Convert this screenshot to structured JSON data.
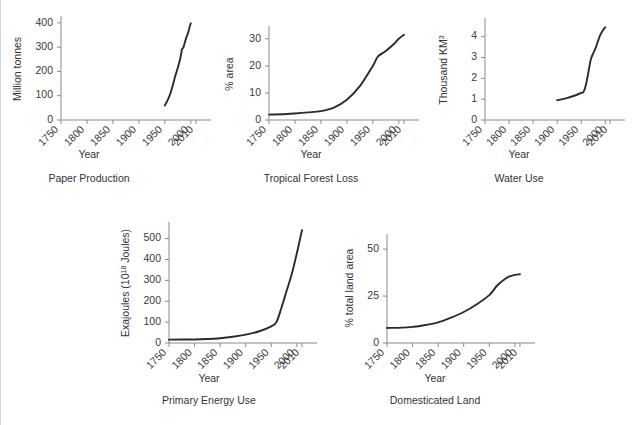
{
  "figure": {
    "background": "#ffffff",
    "line_color": "#2b2b2b",
    "axis_color": "#8a8a8a",
    "border_color": "#d8d8d8",
    "shared_xlabel": "Year",
    "shared_xticks": [
      "1750",
      "1800",
      "1850",
      "1900",
      "1950",
      "2000",
      "2010"
    ]
  },
  "chart_data": [
    {
      "type": "line",
      "title": "Paper Production",
      "xlabel": "Year",
      "ylabel": "Million tonnes",
      "xlim": [
        1750,
        2012
      ],
      "ylim": [
        0,
        420
      ],
      "xticks": [
        1750,
        1800,
        1850,
        1900,
        1950,
        2000,
        2010
      ],
      "xtick_labels": [
        "1750",
        "1800",
        "1850",
        "1900",
        "1950",
        "2000",
        "2010"
      ],
      "yticks": [
        0,
        100,
        200,
        300,
        400
      ],
      "ytick_labels": [
        "0",
        "100",
        "200",
        "300",
        "400"
      ],
      "grid": false,
      "legend": "none",
      "x": [
        1950,
        1955,
        1960,
        1965,
        1970,
        1975,
        1980,
        1983,
        1986,
        1990,
        1995,
        1998,
        2000
      ],
      "y": [
        60,
        80,
        105,
        140,
        180,
        215,
        255,
        290,
        300,
        330,
        360,
        385,
        398
      ]
    },
    {
      "type": "line",
      "title": "Tropical Forest Loss",
      "xlabel": "Year",
      "ylabel": "% area",
      "xlim": [
        1750,
        2012
      ],
      "ylim": [
        0,
        34
      ],
      "xticks": [
        1750,
        1800,
        1850,
        1900,
        1950,
        2000,
        2010
      ],
      "xtick_labels": [
        "1750",
        "1800",
        "1850",
        "1900",
        "1950",
        "2000",
        "2010"
      ],
      "yticks": [
        0,
        10,
        20,
        30
      ],
      "ytick_labels": [
        "0",
        "10",
        "20",
        "30"
      ],
      "grid": false,
      "legend": "none",
      "x": [
        1750,
        1775,
        1800,
        1825,
        1850,
        1875,
        1900,
        1925,
        1950,
        1960,
        1975,
        1990,
        2000,
        2010
      ],
      "y": [
        2.0,
        2.1,
        2.4,
        2.8,
        3.3,
        4.6,
        7.5,
        12.5,
        20.0,
        23.5,
        25.5,
        28.0,
        30.0,
        31.5
      ]
    },
    {
      "type": "line",
      "title": "Water Use",
      "xlabel": "Year",
      "ylabel": "Thousand KM³",
      "ylabel_base": "Thousand KM",
      "ylabel_sup": "3",
      "xlim": [
        1750,
        2012
      ],
      "ylim": [
        0,
        4.8
      ],
      "xticks": [
        1750,
        1800,
        1850,
        1900,
        1950,
        2000,
        2010
      ],
      "xtick_labels": [
        "1750",
        "1800",
        "1850",
        "1900",
        "1950",
        "2000",
        "2010"
      ],
      "yticks": [
        0,
        1,
        2,
        3,
        4
      ],
      "ytick_labels": [
        "0",
        "1",
        "2",
        "3",
        "4"
      ],
      "grid": false,
      "legend": "none",
      "x": [
        1900,
        1920,
        1940,
        1950,
        1955,
        1960,
        1965,
        1970,
        1975,
        1980,
        1985,
        1990,
        1995,
        2000
      ],
      "y": [
        0.95,
        1.05,
        1.2,
        1.3,
        1.35,
        1.7,
        2.3,
        2.9,
        3.2,
        3.45,
        3.8,
        4.1,
        4.3,
        4.45
      ]
    },
    {
      "type": "line",
      "title": "Primary Energy Use",
      "xlabel": "Year",
      "ylabel": "Exajoules (10¹⁸ Joules)",
      "ylabel_base": "Exajoules (10",
      "ylabel_sup": "18",
      "ylabel_tail": " Joules)",
      "xlim": [
        1750,
        2012
      ],
      "ylim": [
        0,
        570
      ],
      "xticks": [
        1750,
        1800,
        1850,
        1900,
        1950,
        2000,
        2010
      ],
      "xtick_labels": [
        "1750",
        "1800",
        "1850",
        "1900",
        "1950",
        "2000",
        "2010"
      ],
      "yticks": [
        0,
        100,
        200,
        300,
        400,
        500
      ],
      "ytick_labels": [
        "0",
        "100",
        "200",
        "300",
        "400",
        "500"
      ],
      "grid": false,
      "legend": "none",
      "x": [
        1750,
        1800,
        1825,
        1850,
        1875,
        1900,
        1925,
        1950,
        1960,
        1970,
        1980,
        1990,
        2000,
        2010
      ],
      "y": [
        16,
        17,
        19,
        23,
        30,
        40,
        55,
        80,
        100,
        170,
        250,
        330,
        430,
        540
      ]
    },
    {
      "type": "line",
      "title": "Domesticated Land",
      "xlabel": "Year",
      "ylabel": "% total land area",
      "xlim": [
        1750,
        2012
      ],
      "ylim": [
        0,
        57
      ],
      "xticks": [
        1750,
        1800,
        1850,
        1900,
        1950,
        2000,
        2010
      ],
      "xtick_labels": [
        "1750",
        "1800",
        "1850",
        "1900",
        "1950",
        "2000",
        "2010"
      ],
      "yticks": [
        0,
        25,
        50
      ],
      "ytick_labels": [
        "0",
        "25",
        "50"
      ],
      "grid": false,
      "legend": "none",
      "x": [
        1750,
        1780,
        1800,
        1820,
        1850,
        1875,
        1900,
        1925,
        1950,
        1965,
        1980,
        1990,
        2000,
        2010
      ],
      "y": [
        8.0,
        8.2,
        8.6,
        9.3,
        11.0,
        13.5,
        16.5,
        20.5,
        25.5,
        30.5,
        34.0,
        35.5,
        36.3,
        36.6
      ]
    }
  ]
}
